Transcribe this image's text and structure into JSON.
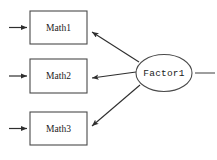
{
  "diagram": {
    "type": "path-diagram",
    "canvas": {
      "width": 217,
      "height": 160,
      "background": "#ffffff"
    },
    "style": {
      "node_stroke": "#4a4a4a",
      "edge_stroke": "#2e2e2e",
      "node_fill": "#ffffff",
      "text_color": "#1a1a1a"
    },
    "observed_variables": [
      {
        "label": "Math1",
        "shape": "rectangle",
        "x": 30,
        "y": 11,
        "width": 57,
        "height": 33,
        "cx": 58.5,
        "cy": 27.5
      },
      {
        "label": "Math2",
        "shape": "rectangle",
        "x": 30,
        "y": 59,
        "width": 57,
        "height": 34,
        "cx": 58.5,
        "cy": 76
      },
      {
        "label": "Math3",
        "shape": "rectangle",
        "x": 30,
        "y": 112,
        "width": 57,
        "height": 33,
        "cx": 58.5,
        "cy": 128.5
      }
    ],
    "latent_variables": [
      {
        "label": "Factor1",
        "shape": "ellipse",
        "cx": 164,
        "cy": 73,
        "rx": 28,
        "ry": 18.5
      }
    ],
    "loadings": [
      {
        "from": "Factor1",
        "to": "Math1",
        "arrowhead": "at-target"
      },
      {
        "from": "Factor1",
        "to": "Math2",
        "arrowhead": "at-target"
      },
      {
        "from": "Factor1",
        "to": "Math3",
        "arrowhead": "at-target"
      }
    ],
    "residual_arrows": [
      {
        "to": "Math1",
        "direction": "right",
        "x1": 9,
        "x2": 30,
        "y": 27.5
      },
      {
        "to": "Math2",
        "direction": "right",
        "x1": 9,
        "x2": 30,
        "y": 76
      },
      {
        "to": "Math3",
        "direction": "right",
        "x1": 9,
        "x2": 30,
        "y": 128.5
      }
    ],
    "stub_lines": [
      {
        "from": "Factor1",
        "direction": "right",
        "x1": 196,
        "x2": 215,
        "y": 73
      }
    ]
  }
}
